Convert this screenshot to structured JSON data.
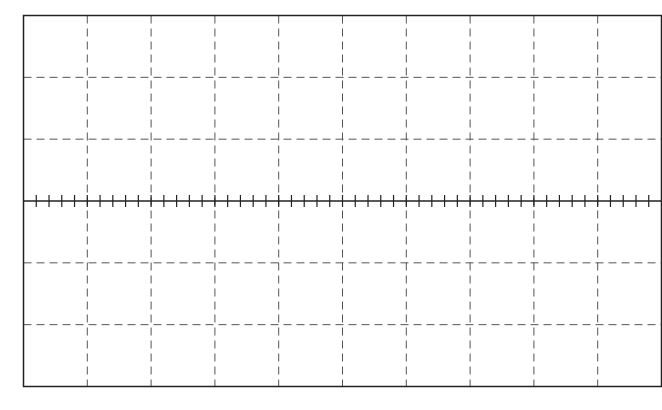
{
  "graticule": {
    "frame": {
      "x": 23.5,
      "y": 15.5,
      "width": 638,
      "height": 371
    },
    "columns": 10,
    "rows": 6,
    "minor_ticks_per_division": 5,
    "tick_half_length": 6,
    "colors": {
      "frame": "#222222",
      "grid": "#555555",
      "center_axis": "#222222",
      "background": "#ffffff"
    },
    "dash_pattern": "8,5"
  }
}
